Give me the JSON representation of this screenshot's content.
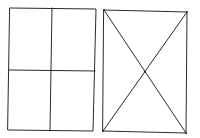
{
  "diagram": {
    "colors": {
      "background": "#ffffff",
      "line": "#2a2a2a"
    },
    "figures": [
      {
        "id": "quartered-rectangle",
        "description": "Rectangle divided into four quadrants by a vertical and a horizontal line",
        "corners": {
          "tl": [
            10,
            8
          ],
          "tr": [
            96,
            9
          ],
          "br": [
            93,
            131
          ],
          "bl": [
            8,
            130
          ]
        },
        "vertical_divider": {
          "from": [
            52,
            8
          ],
          "to": [
            50,
            131
          ]
        },
        "horizontal_divider": {
          "from": [
            9,
            70
          ],
          "to": [
            95,
            71
          ]
        }
      },
      {
        "id": "diagonal-rectangle",
        "description": "Rectangle with both diagonals drawn, crossing at the center",
        "corners": {
          "tl": [
            104,
            10
          ],
          "tr": [
            187,
            12
          ],
          "br": [
            186,
            133
          ],
          "bl": [
            103,
            131
          ]
        },
        "diagonals": [
          {
            "from": [
              104,
              10
            ],
            "to": [
              186,
              133
            ]
          },
          {
            "from": [
              187,
              12
            ],
            "to": [
              103,
              131
            ]
          }
        ],
        "intersection": [
          145,
          72
        ]
      }
    ]
  }
}
